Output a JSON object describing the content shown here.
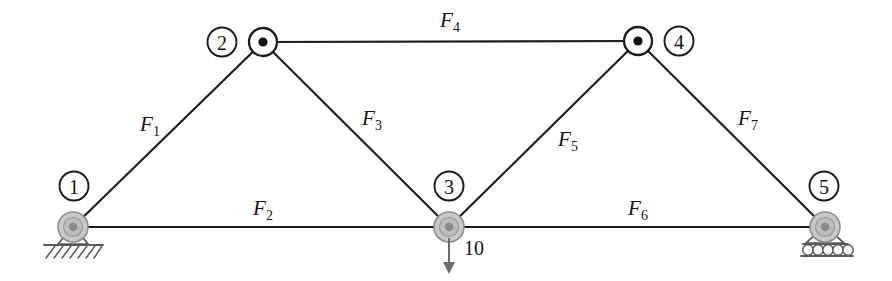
{
  "figure": {
    "type": "truss-diagram",
    "width": 892,
    "height": 281,
    "background_color": "#ffffff",
    "line_color": "#1c1c1c",
    "support_color": "#5a5a5a",
    "node_fill_color": "#c9c9c9",
    "load_color": "#6d6d6d"
  },
  "nodes": [
    {
      "id": "1",
      "label": "1",
      "x": 73,
      "y": 227,
      "label_x": 74,
      "label_y": 186,
      "kind": "support",
      "support": "pin"
    },
    {
      "id": "2",
      "label": "2",
      "x": 263,
      "y": 42,
      "label_x": 222,
      "label_y": 42,
      "kind": "joint",
      "support": "none"
    },
    {
      "id": "3",
      "label": "3",
      "x": 449,
      "y": 227,
      "label_x": 449,
      "label_y": 186,
      "kind": "loaded",
      "support": "none"
    },
    {
      "id": "4",
      "label": "4",
      "x": 638,
      "y": 41,
      "label_x": 679,
      "label_y": 41,
      "kind": "joint",
      "support": "none"
    },
    {
      "id": "5",
      "label": "5",
      "x": 825,
      "y": 227,
      "label_x": 824,
      "label_y": 186,
      "kind": "support",
      "support": "roller"
    }
  ],
  "members": [
    {
      "id": "F1",
      "base": "F",
      "sub": "1",
      "from": "1",
      "to": "2",
      "label_x": 150,
      "label_y": 131,
      "x1": 73,
      "y1": 227,
      "x2": 263,
      "y2": 42
    },
    {
      "id": "F2",
      "base": "F",
      "sub": "2",
      "from": "1",
      "to": "3",
      "label_x": 263,
      "label_y": 215,
      "x1": 73,
      "y1": 227,
      "x2": 449,
      "y2": 227
    },
    {
      "id": "F3",
      "base": "F",
      "sub": "3",
      "from": "2",
      "to": "3",
      "label_x": 372,
      "label_y": 125,
      "x1": 263,
      "y1": 42,
      "x2": 449,
      "y2": 227
    },
    {
      "id": "F4",
      "base": "F",
      "sub": "4",
      "from": "2",
      "to": "4",
      "label_x": 450,
      "label_y": 27,
      "x1": 263,
      "y1": 42,
      "x2": 638,
      "y2": 41
    },
    {
      "id": "F5",
      "base": "F",
      "sub": "5",
      "from": "3",
      "to": "4",
      "label_x": 568,
      "label_y": 146,
      "x1": 449,
      "y1": 227,
      "x2": 638,
      "y2": 41
    },
    {
      "id": "F6",
      "base": "F",
      "sub": "6",
      "from": "3",
      "to": "5",
      "label_x": 638,
      "label_y": 215,
      "x1": 449,
      "y1": 227,
      "x2": 825,
      "y2": 227
    },
    {
      "id": "F7",
      "base": "F",
      "sub": "7",
      "from": "4",
      "to": "5",
      "label_x": 748,
      "label_y": 125,
      "x1": 638,
      "y1": 41,
      "x2": 825,
      "y2": 227
    }
  ],
  "loads": [
    {
      "id": "load-node-3",
      "magnitude": "10",
      "at_node": "3",
      "direction": "down",
      "x": 449,
      "y_start": 238,
      "y_end": 272,
      "label_x": 464,
      "label_y": 255
    }
  ],
  "supports": [
    {
      "id": "support-1",
      "node": "1",
      "type": "pin",
      "x": 73,
      "y": 227
    },
    {
      "id": "support-5",
      "node": "5",
      "type": "roller",
      "x": 825,
      "y": 227,
      "roller_count": 6
    }
  ]
}
